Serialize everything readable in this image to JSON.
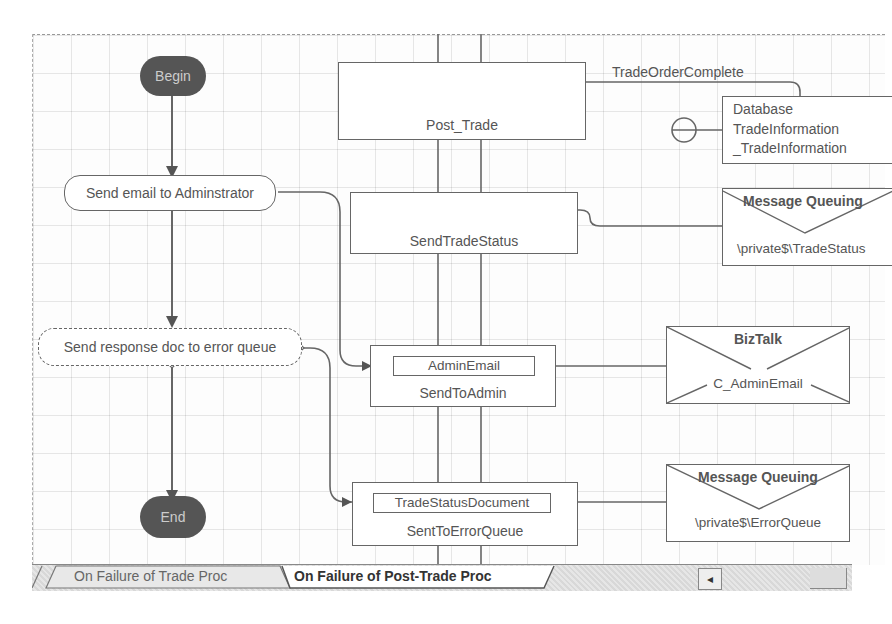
{
  "diagram": {
    "type": "BizTalk orchestration",
    "shapes": {
      "begin": {
        "label": "Begin"
      },
      "send_email": {
        "label": "Send email to Adminstrator"
      },
      "send_response": {
        "label": "Send response doc to error queue"
      },
      "end": {
        "label": "End"
      }
    },
    "ports": {
      "post_trade": {
        "label": "Post_Trade"
      },
      "send_trade_status": {
        "label": "SendTradeStatus"
      },
      "send_to_admin": {
        "label": "SendToAdmin",
        "message": "AdminEmail"
      },
      "sent_to_error_queue": {
        "label": "SentToErrorQueue",
        "message": "TradeStatusDocument"
      }
    },
    "connector_labels": {
      "trade_order_complete": "TradeOrderComplete"
    },
    "bindings": {
      "database": {
        "line1": "Database",
        "line2": "TradeInformation",
        "line3": "_TradeInformation"
      },
      "mq_trade_status": {
        "title": "Message Queuing",
        "subtitle": "\\private$\\TradeStatus"
      },
      "biztalk_admin": {
        "title": "BizTalk",
        "subtitle": "C_AdminEmail"
      },
      "mq_error": {
        "title": "Message Queuing",
        "subtitle": "\\private$\\ErrorQueue"
      }
    }
  },
  "tabs": [
    {
      "label": "On Failure of Trade Proc",
      "active": false
    },
    {
      "label": "On Failure of Post-Trade Proc",
      "active": true
    }
  ],
  "scrollbar": {
    "left_arrow": "◂"
  }
}
